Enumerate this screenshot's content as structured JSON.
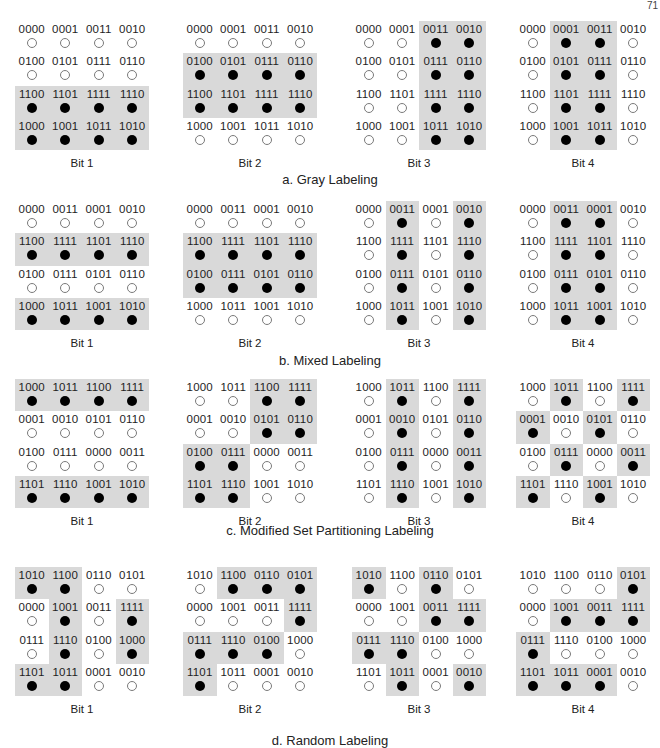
{
  "corner_mark": "71",
  "sections": [
    {
      "title": "a. Gray Labeling",
      "panels": [
        {
          "bit": "Bit 1",
          "labels": [
            [
              "0000",
              "0001",
              "0011",
              "0010"
            ],
            [
              "0100",
              "0101",
              "0111",
              "0110"
            ],
            [
              "1100",
              "1101",
              "1111",
              "1110"
            ],
            [
              "1000",
              "1001",
              "1011",
              "1010"
            ]
          ],
          "filled": [
            [
              0,
              0,
              0,
              0
            ],
            [
              0,
              0,
              0,
              0
            ],
            [
              1,
              1,
              1,
              1
            ],
            [
              1,
              1,
              1,
              1
            ]
          ]
        },
        {
          "bit": "Bit 2",
          "labels": [
            [
              "0000",
              "0001",
              "0011",
              "0010"
            ],
            [
              "0100",
              "0101",
              "0111",
              "0110"
            ],
            [
              "1100",
              "1101",
              "1111",
              "1110"
            ],
            [
              "1000",
              "1001",
              "1011",
              "1010"
            ]
          ],
          "filled": [
            [
              0,
              0,
              0,
              0
            ],
            [
              1,
              1,
              1,
              1
            ],
            [
              1,
              1,
              1,
              1
            ],
            [
              0,
              0,
              0,
              0
            ]
          ]
        },
        {
          "bit": "Bit 3",
          "labels": [
            [
              "0000",
              "0001",
              "0011",
              "0010"
            ],
            [
              "0100",
              "0101",
              "0111",
              "0110"
            ],
            [
              "1100",
              "1101",
              "1111",
              "1110"
            ],
            [
              "1000",
              "1001",
              "1011",
              "1010"
            ]
          ],
          "filled": [
            [
              0,
              0,
              1,
              1
            ],
            [
              0,
              0,
              1,
              1
            ],
            [
              0,
              0,
              1,
              1
            ],
            [
              0,
              0,
              1,
              1
            ]
          ]
        },
        {
          "bit": "Bit 4",
          "labels": [
            [
              "0000",
              "0001",
              "0011",
              "0010"
            ],
            [
              "0100",
              "0101",
              "0111",
              "0110"
            ],
            [
              "1100",
              "1101",
              "1111",
              "1110"
            ],
            [
              "1000",
              "1001",
              "1011",
              "1010"
            ]
          ],
          "filled": [
            [
              0,
              1,
              1,
              0
            ],
            [
              0,
              1,
              1,
              0
            ],
            [
              0,
              1,
              1,
              0
            ],
            [
              0,
              1,
              1,
              0
            ]
          ]
        }
      ]
    },
    {
      "title": "b. Mixed Labeling",
      "panels": [
        {
          "bit": "Bit 1",
          "labels": [
            [
              "0000",
              "0011",
              "0001",
              "0010"
            ],
            [
              "1100",
              "1111",
              "1101",
              "1110"
            ],
            [
              "0100",
              "0111",
              "0101",
              "0110"
            ],
            [
              "1000",
              "1011",
              "1001",
              "1010"
            ]
          ],
          "filled": [
            [
              0,
              0,
              0,
              0
            ],
            [
              1,
              1,
              1,
              1
            ],
            [
              0,
              0,
              0,
              0
            ],
            [
              1,
              1,
              1,
              1
            ]
          ]
        },
        {
          "bit": "Bit 2",
          "labels": [
            [
              "0000",
              "0011",
              "0001",
              "0010"
            ],
            [
              "1100",
              "1111",
              "1101",
              "1110"
            ],
            [
              "0100",
              "0111",
              "0101",
              "0110"
            ],
            [
              "1000",
              "1011",
              "1001",
              "1010"
            ]
          ],
          "filled": [
            [
              0,
              0,
              0,
              0
            ],
            [
              1,
              1,
              1,
              1
            ],
            [
              1,
              1,
              1,
              1
            ],
            [
              0,
              0,
              0,
              0
            ]
          ]
        },
        {
          "bit": "Bit 3",
          "labels": [
            [
              "0000",
              "0011",
              "0001",
              "0010"
            ],
            [
              "1100",
              "1111",
              "1101",
              "1110"
            ],
            [
              "0100",
              "0111",
              "0101",
              "0110"
            ],
            [
              "1000",
              "1011",
              "1001",
              "1010"
            ]
          ],
          "filled": [
            [
              0,
              1,
              0,
              1
            ],
            [
              0,
              1,
              0,
              1
            ],
            [
              0,
              1,
              0,
              1
            ],
            [
              0,
              1,
              0,
              1
            ]
          ]
        },
        {
          "bit": "Bit 4",
          "labels": [
            [
              "0000",
              "0011",
              "0001",
              "0010"
            ],
            [
              "1100",
              "1111",
              "1101",
              "1110"
            ],
            [
              "0100",
              "0111",
              "0101",
              "0110"
            ],
            [
              "1000",
              "1011",
              "1001",
              "1010"
            ]
          ],
          "filled": [
            [
              0,
              1,
              1,
              0
            ],
            [
              0,
              1,
              1,
              0
            ],
            [
              0,
              1,
              1,
              0
            ],
            [
              0,
              1,
              1,
              0
            ]
          ]
        }
      ]
    },
    {
      "title": "c. Modified Set Partitioning Labeling",
      "panels": [
        {
          "bit": "Bit 1",
          "labels": [
            [
              "1000",
              "1011",
              "1100",
              "1111"
            ],
            [
              "0001",
              "0010",
              "0101",
              "0110"
            ],
            [
              "0100",
              "0111",
              "0000",
              "0011"
            ],
            [
              "1101",
              "1110",
              "1001",
              "1010"
            ]
          ],
          "filled": [
            [
              1,
              1,
              1,
              1
            ],
            [
              0,
              0,
              0,
              0
            ],
            [
              0,
              0,
              0,
              0
            ],
            [
              1,
              1,
              1,
              1
            ]
          ]
        },
        {
          "bit": "Bit 2",
          "labels": [
            [
              "1000",
              "1011",
              "1100",
              "1111"
            ],
            [
              "0001",
              "0010",
              "0101",
              "0110"
            ],
            [
              "0100",
              "0111",
              "0000",
              "0011"
            ],
            [
              "1101",
              "1110",
              "1001",
              "1010"
            ]
          ],
          "filled": [
            [
              0,
              0,
              1,
              1
            ],
            [
              0,
              0,
              1,
              1
            ],
            [
              1,
              1,
              0,
              0
            ],
            [
              1,
              1,
              0,
              0
            ]
          ]
        },
        {
          "bit": "Bit 3",
          "labels": [
            [
              "1000",
              "1011",
              "1100",
              "1111"
            ],
            [
              "0001",
              "0010",
              "0101",
              "0110"
            ],
            [
              "0100",
              "0111",
              "0000",
              "0011"
            ],
            [
              "1101",
              "1110",
              "1001",
              "1010"
            ]
          ],
          "filled": [
            [
              0,
              1,
              0,
              1
            ],
            [
              0,
              1,
              0,
              1
            ],
            [
              0,
              1,
              0,
              1
            ],
            [
              0,
              1,
              0,
              1
            ]
          ]
        },
        {
          "bit": "Bit 4",
          "labels": [
            [
              "1000",
              "1011",
              "1100",
              "1111"
            ],
            [
              "0001",
              "0010",
              "0101",
              "0110"
            ],
            [
              "0100",
              "0111",
              "0000",
              "0011"
            ],
            [
              "1101",
              "1110",
              "1001",
              "1010"
            ]
          ],
          "filled": [
            [
              0,
              1,
              0,
              1
            ],
            [
              1,
              0,
              1,
              0
            ],
            [
              0,
              1,
              0,
              1
            ],
            [
              1,
              0,
              1,
              0
            ]
          ]
        }
      ]
    },
    {
      "title": "d. Random Labeling",
      "panels": [
        {
          "bit": "Bit 1",
          "labels": [
            [
              "1010",
              "1100",
              "0110",
              "0101"
            ],
            [
              "0000",
              "1001",
              "0011",
              "1111"
            ],
            [
              "0111",
              "1110",
              "0100",
              "1000"
            ],
            [
              "1101",
              "1011",
              "0001",
              "0010"
            ]
          ],
          "filled": [
            [
              1,
              1,
              0,
              0
            ],
            [
              0,
              1,
              0,
              1
            ],
            [
              0,
              1,
              0,
              1
            ],
            [
              1,
              1,
              0,
              0
            ]
          ]
        },
        {
          "bit": "Bit 2",
          "labels": [
            [
              "1010",
              "1100",
              "0110",
              "0101"
            ],
            [
              "0000",
              "1001",
              "0011",
              "1111"
            ],
            [
              "0111",
              "1110",
              "0100",
              "1000"
            ],
            [
              "1101",
              "1011",
              "0001",
              "0010"
            ]
          ],
          "filled": [
            [
              0,
              1,
              1,
              1
            ],
            [
              0,
              0,
              0,
              1
            ],
            [
              1,
              1,
              1,
              0
            ],
            [
              1,
              0,
              0,
              0
            ]
          ]
        },
        {
          "bit": "Bit 3",
          "labels": [
            [
              "1010",
              "1100",
              "0110",
              "0101"
            ],
            [
              "0000",
              "1001",
              "0011",
              "1111"
            ],
            [
              "0111",
              "1110",
              "0100",
              "1000"
            ],
            [
              "1101",
              "1011",
              "0001",
              "0010"
            ]
          ],
          "filled": [
            [
              1,
              0,
              1,
              0
            ],
            [
              0,
              0,
              1,
              1
            ],
            [
              1,
              1,
              0,
              0
            ],
            [
              0,
              1,
              0,
              1
            ]
          ]
        },
        {
          "bit": "Bit 4",
          "labels": [
            [
              "1010",
              "1100",
              "0110",
              "0101"
            ],
            [
              "0000",
              "1001",
              "0011",
              "1111"
            ],
            [
              "0111",
              "1110",
              "0100",
              "1000"
            ],
            [
              "1101",
              "1011",
              "0001",
              "0010"
            ]
          ],
          "filled": [
            [
              0,
              0,
              0,
              1
            ],
            [
              0,
              1,
              1,
              1
            ],
            [
              1,
              0,
              0,
              0
            ],
            [
              1,
              1,
              1,
              0
            ]
          ]
        }
      ]
    }
  ],
  "layout": {
    "section_tops": [
      21,
      201,
      379,
      567
    ],
    "panel_lefts": [
      15,
      183,
      352,
      516
    ],
    "bit_label_offset": 136,
    "title_offsets": [
      151,
      152,
      144,
      166
    ]
  }
}
